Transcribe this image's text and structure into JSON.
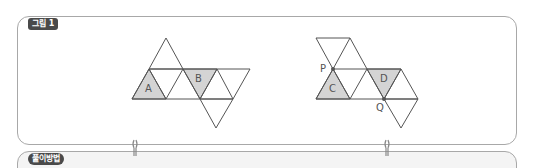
{
  "figure_panel": {
    "tag_label": "그림 1",
    "left_net": {
      "labels": {
        "a": "A",
        "b": "B"
      }
    },
    "right_net": {
      "labels": {
        "c": "C",
        "d": "D",
        "p": "P",
        "q": "Q"
      }
    }
  },
  "method_panel": {
    "tag_label": "풀이방법"
  },
  "colors": {
    "line": "#555555",
    "shade": "#d4d4d4",
    "border": "#a8a8a8",
    "tag_bg": "#4a4a4a"
  }
}
